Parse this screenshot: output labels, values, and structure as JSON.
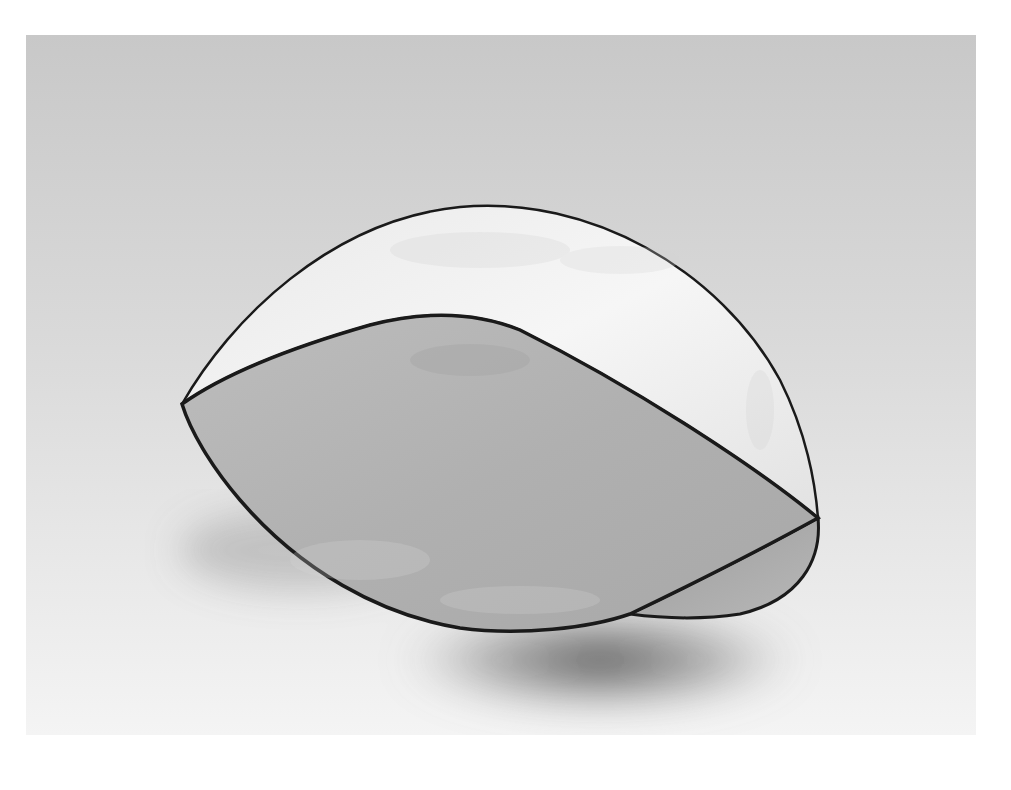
{
  "image": {
    "subject": "abstract sculpture",
    "palette": {
      "background_light": "#ffffff",
      "backdrop_top": "#c9c9c9",
      "backdrop_bottom": "#f2f2f2",
      "top_surface": "#f3f3f3",
      "front_surface": "#b3b3b3",
      "edge": "#1a1a1a",
      "shadow": "#555555"
    }
  }
}
